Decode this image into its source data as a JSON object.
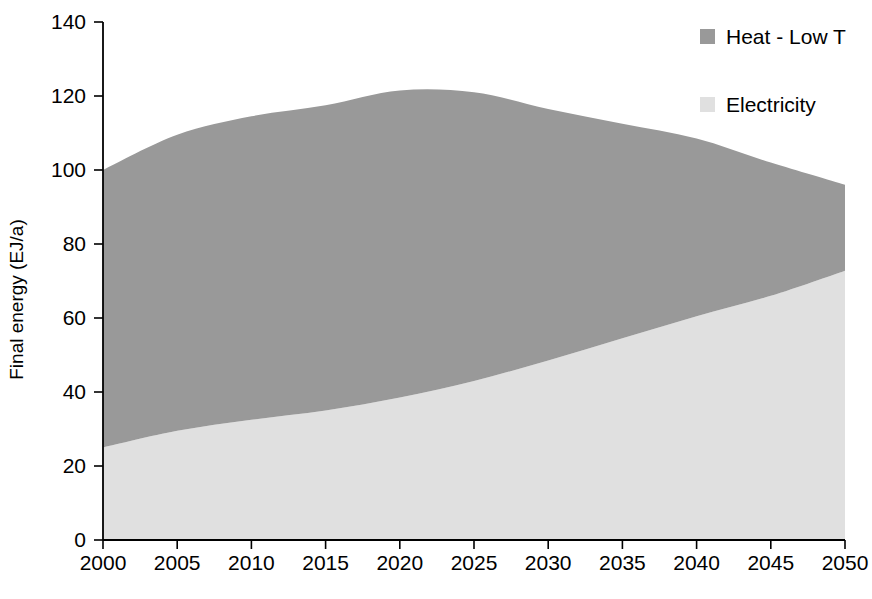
{
  "chart_data": {
    "type": "area",
    "stacked": true,
    "title": "",
    "xlabel": "",
    "ylabel": "Final energy (EJ/a)",
    "xlim": [
      2000,
      2050
    ],
    "ylim": [
      0,
      140
    ],
    "ytick_labels": [
      "140",
      "120",
      "100",
      "80",
      "60",
      "40",
      "20",
      "0"
    ],
    "yticks": [
      140,
      120,
      100,
      80,
      60,
      40,
      20,
      0
    ],
    "xtick_labels": [
      "2000",
      "2005",
      "2010",
      "2015",
      "2020",
      "2025",
      "2030",
      "2035",
      "2040",
      "2045",
      "2050"
    ],
    "xticks": [
      2000,
      2005,
      2010,
      2015,
      2020,
      2025,
      2030,
      2035,
      2040,
      2045,
      2050
    ],
    "grid": false,
    "legend_position": "top-right",
    "x": [
      2000,
      2005,
      2010,
      2015,
      2020,
      2025,
      2030,
      2035,
      2040,
      2045,
      2050
    ],
    "series": [
      {
        "name": "Electricity",
        "color": "#e0e0e0",
        "values": [
          25.0,
          29.5,
          32.5,
          35.0,
          38.5,
          43.0,
          48.5,
          54.5,
          60.5,
          66.0,
          72.8
        ]
      },
      {
        "name": "Heat - Low T",
        "color": "#999999",
        "values": [
          75.0,
          80.0,
          82.0,
          82.5,
          83.0,
          78.0,
          68.0,
          58.0,
          48.0,
          36.0,
          23.2
        ]
      }
    ],
    "totals": [
      100.0,
      109.5,
      114.5,
      117.5,
      121.5,
      121.0,
      116.5,
      112.5,
      108.5,
      102.0,
      96.0
    ],
    "legend": [
      {
        "label": "Heat - Low T",
        "color": "#999999"
      },
      {
        "label": "Electricity",
        "color": "#e0e0e0"
      }
    ]
  },
  "axis": {
    "y_title": "Final energy (EJ/a)"
  }
}
